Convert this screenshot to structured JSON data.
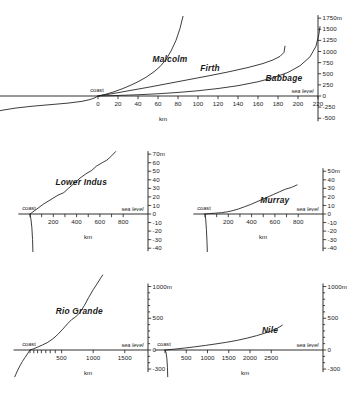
{
  "figure": {
    "background": "#ffffff",
    "ink": "#1a1a1a",
    "common": {
      "xlabel": "km",
      "coast_label": "coast",
      "sea_level_label": "sea level",
      "unit_suffix": "m"
    }
  },
  "chart_data": [
    {
      "id": "panel-arctic",
      "type": "line",
      "title": "",
      "xlabel": "km",
      "ylabel": "",
      "grid": false,
      "legend": "inline-curve-labels",
      "xlim": [
        -120,
        232
      ],
      "ylim": [
        -500,
        1750
      ],
      "xticks": [
        0,
        20,
        40,
        60,
        80,
        100,
        120,
        140,
        160,
        180,
        200,
        220
      ],
      "xticklabels": [
        "0",
        "20",
        "40",
        "60",
        "80",
        "100",
        "120",
        "140",
        "160",
        "180",
        "200",
        "220"
      ],
      "yticks": [
        -500,
        -250,
        0,
        250,
        500,
        750,
        1000,
        1250,
        1500,
        1750
      ],
      "yticklabels": [
        "-500",
        "-250",
        "0",
        "250",
        "500",
        "750",
        "1000",
        "1250",
        "1500",
        "1750m"
      ],
      "annotations": [
        "coast",
        "sea level"
      ],
      "series": [
        {
          "name": "Malcolm",
          "label_x": 72,
          "label_y": 760,
          "points": [
            [
              0,
              0
            ],
            [
              8,
              40
            ],
            [
              16,
              95
            ],
            [
              24,
              160
            ],
            [
              32,
              235
            ],
            [
              40,
              320
            ],
            [
              48,
              420
            ],
            [
              56,
              545
            ],
            [
              62,
              660
            ],
            [
              68,
              820
            ],
            [
              73,
              1010
            ],
            [
              78,
              1250
            ],
            [
              82,
              1520
            ],
            [
              85,
              1790
            ]
          ]
        },
        {
          "name": "Firth",
          "label_x": 112,
          "label_y": 560,
          "points": [
            [
              0,
              0
            ],
            [
              15,
              55
            ],
            [
              30,
              115
            ],
            [
              50,
              195
            ],
            [
              70,
              280
            ],
            [
              90,
              365
            ],
            [
              110,
              450
            ],
            [
              130,
              540
            ],
            [
              150,
              640
            ],
            [
              165,
              730
            ],
            [
              175,
              810
            ],
            [
              182,
              890
            ],
            [
              186,
              980
            ],
            [
              187,
              1120
            ]
          ]
        },
        {
          "name": "Babbage",
          "label_x": 186,
          "label_y": 330,
          "points": [
            [
              0,
              0
            ],
            [
              20,
              12
            ],
            [
              40,
              28
            ],
            [
              60,
              50
            ],
            [
              80,
              80
            ],
            [
              100,
              118
            ],
            [
              120,
              168
            ],
            [
              140,
              232
            ],
            [
              160,
              320
            ],
            [
              175,
              410
            ],
            [
              190,
              530
            ],
            [
              202,
              680
            ],
            [
              212,
              880
            ],
            [
              218,
              1120
            ],
            [
              221,
              1400
            ],
            [
              222,
              1560
            ]
          ]
        },
        {
          "name": "offshore-shelf",
          "label_x": null,
          "label_y": null,
          "points": [
            [
              -118,
              -440
            ],
            [
              -108,
              -380
            ],
            [
              -96,
              -320
            ],
            [
              -82,
              -270
            ],
            [
              -66,
              -230
            ],
            [
              -48,
              -195
            ],
            [
              -30,
              -160
            ],
            [
              -16,
              -120
            ],
            [
              -8,
              -80
            ],
            [
              -3,
              -40
            ],
            [
              0,
              0
            ]
          ]
        }
      ]
    },
    {
      "id": "panel-lower-indus",
      "type": "line",
      "title": "Lower Indus",
      "xlabel": "km",
      "ylabel": "",
      "grid": false,
      "xlim": [
        -100,
        900
      ],
      "ylim": [
        -40,
        72
      ],
      "xticks": [
        0,
        100,
        200,
        300,
        400,
        500,
        600,
        700,
        800
      ],
      "xticklabels": [
        "",
        "",
        "200",
        "",
        "400",
        "",
        "600",
        "",
        "800"
      ],
      "yticks": [
        -40,
        -30,
        -20,
        -10,
        0,
        10,
        20,
        30,
        40,
        50,
        60,
        70
      ],
      "yticklabels": [
        "-40",
        "-30",
        "-20",
        "-10",
        "0",
        "10",
        "20",
        "30",
        "40",
        "50",
        "60",
        "70m"
      ],
      "annotations": [
        "coast",
        "sea level"
      ],
      "series": [
        {
          "name": "Lower Indus",
          "label_x": 440,
          "label_y": 34,
          "points": [
            [
              0,
              0
            ],
            [
              20,
              2
            ],
            [
              60,
              6
            ],
            [
              120,
              12
            ],
            [
              180,
              17
            ],
            [
              240,
              22
            ],
            [
              290,
              25
            ],
            [
              330,
              30
            ],
            [
              380,
              36
            ],
            [
              430,
              42
            ],
            [
              480,
              47
            ],
            [
              530,
              51
            ],
            [
              570,
              56
            ],
            [
              620,
              60
            ],
            [
              660,
              63
            ],
            [
              700,
              68
            ],
            [
              735,
              73
            ]
          ]
        },
        {
          "name": "offshore-drop",
          "label_x": null,
          "label_y": null,
          "points": [
            [
              0,
              0
            ],
            [
              8,
              -6
            ],
            [
              16,
              -16
            ],
            [
              22,
              -30
            ],
            [
              25,
              -44
            ]
          ]
        }
      ]
    },
    {
      "id": "panel-murray",
      "type": "line",
      "title": "Murray",
      "xlabel": "km",
      "ylabel": "",
      "grid": false,
      "xlim": [
        -100,
        900
      ],
      "ylim": [
        -40,
        52
      ],
      "xticks": [
        0,
        100,
        200,
        300,
        400,
        500,
        600,
        700,
        800
      ],
      "xticklabels": [
        "",
        "",
        "200",
        "",
        "400",
        "",
        "600",
        "",
        "800"
      ],
      "yticks": [
        -40,
        -30,
        -20,
        -10,
        0,
        10,
        20,
        30,
        40,
        50
      ],
      "yticklabels": [
        "-40",
        "-30",
        "-20",
        "-10",
        "0",
        "10",
        "20",
        "30",
        "40",
        "50m"
      ],
      "annotations": [
        "coast",
        "sea level"
      ],
      "series": [
        {
          "name": "Murray",
          "label_x": 600,
          "label_y": 13,
          "points": [
            [
              0,
              0
            ],
            [
              40,
              0.5
            ],
            [
              90,
              1
            ],
            [
              140,
              1.5
            ],
            [
              190,
              2.5
            ],
            [
              240,
              4
            ],
            [
              290,
              6
            ],
            [
              340,
              8.5
            ],
            [
              390,
              11
            ],
            [
              440,
              14
            ],
            [
              490,
              17
            ],
            [
              540,
              20
            ],
            [
              590,
              23
            ],
            [
              640,
              26
            ],
            [
              690,
              29
            ],
            [
              740,
              31
            ],
            [
              790,
              34
            ]
          ]
        },
        {
          "name": "offshore-drop",
          "label_x": null,
          "label_y": null,
          "points": [
            [
              0,
              0
            ],
            [
              6,
              -6
            ],
            [
              12,
              -18
            ],
            [
              17,
              -32
            ],
            [
              20,
              -44
            ]
          ]
        }
      ]
    },
    {
      "id": "panel-rio-grande",
      "type": "line",
      "title": "Rio Grande",
      "xlabel": "km",
      "ylabel": "",
      "grid": false,
      "xlim": [
        -260,
        1700
      ],
      "ylim": [
        -400,
        1200
      ],
      "xticks": [
        0,
        60,
        120,
        180,
        250,
        320,
        400,
        500,
        1000,
        1500
      ],
      "xticklabels": [
        "",
        "",
        "",
        "",
        "",
        "",
        "",
        "500",
        "1000",
        "1500"
      ],
      "yticks": [
        -300,
        0,
        500,
        1000
      ],
      "yticklabels": [
        "-300",
        "0",
        "500",
        "1000m"
      ],
      "annotations": [
        "coast",
        "sea level"
      ],
      "series": [
        {
          "name": "Rio Grande",
          "label_x": 780,
          "label_y": 560,
          "points": [
            [
              0,
              0
            ],
            [
              60,
              20
            ],
            [
              130,
              50
            ],
            [
              200,
              80
            ],
            [
              280,
              120
            ],
            [
              360,
              175
            ],
            [
              440,
              245
            ],
            [
              520,
              330
            ],
            [
              600,
              420
            ],
            [
              660,
              480
            ],
            [
              720,
              520
            ],
            [
              790,
              590
            ],
            [
              860,
              700
            ],
            [
              930,
              830
            ],
            [
              1000,
              950
            ],
            [
              1060,
              1040
            ],
            [
              1110,
              1120
            ],
            [
              1150,
              1180
            ]
          ]
        },
        {
          "name": "offshore-drop",
          "label_x": null,
          "label_y": null,
          "points": [
            [
              -240,
              -420
            ],
            [
              -200,
              -330
            ],
            [
              -160,
              -250
            ],
            [
              -120,
              -180
            ],
            [
              -80,
              -120
            ],
            [
              -40,
              -60
            ],
            [
              -14,
              -20
            ],
            [
              0,
              0
            ]
          ]
        }
      ]
    },
    {
      "id": "panel-nile",
      "type": "line",
      "title": "Nile",
      "xlabel": "km",
      "ylabel": "",
      "grid": false,
      "xlim": [
        -240,
        2900
      ],
      "ylim": [
        -400,
        1200
      ],
      "xticks": [
        0,
        500,
        1000,
        1500,
        2000,
        2500
      ],
      "xticklabels": [
        "",
        "500",
        "1000",
        "1500",
        "2000",
        "2500"
      ],
      "yticks": [
        -300,
        0,
        500,
        1000
      ],
      "yticklabels": [
        "-300",
        "0",
        "500",
        "1000m"
      ],
      "annotations": [
        "coast",
        "sea level"
      ],
      "series": [
        {
          "name": "Nile",
          "label_x": 2470,
          "label_y": 260,
          "points": [
            [
              0,
              0
            ],
            [
              200,
              12
            ],
            [
              450,
              30
            ],
            [
              700,
              50
            ],
            [
              950,
              72
            ],
            [
              1200,
              96
            ],
            [
              1450,
              122
            ],
            [
              1700,
              152
            ],
            [
              1950,
              190
            ],
            [
              2150,
              225
            ],
            [
              2350,
              265
            ],
            [
              2500,
              300
            ],
            [
              2650,
              345
            ],
            [
              2760,
              390
            ]
          ]
        },
        {
          "name": "offshore-drop",
          "label_x": null,
          "label_y": null,
          "points": [
            [
              0,
              0
            ],
            [
              25,
              -40
            ],
            [
              45,
              -140
            ],
            [
              58,
              -280
            ],
            [
              64,
              -420
            ]
          ]
        }
      ]
    }
  ]
}
